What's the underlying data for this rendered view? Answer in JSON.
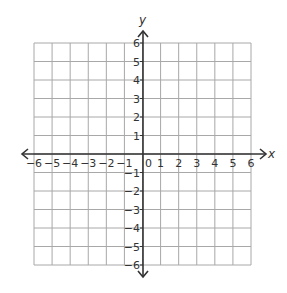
{
  "chart_data": {
    "type": "coordinate-grid",
    "title": "",
    "xlabel": "x",
    "ylabel": "y",
    "xlim": [
      -6,
      6
    ],
    "ylim": [
      -6,
      6
    ],
    "grid": true,
    "x_ticks": [
      "−6",
      "−5",
      "−4",
      "−3",
      "−2",
      "−1",
      "0",
      "1",
      "2",
      "3",
      "4",
      "5",
      "6"
    ],
    "y_ticks": [
      "6",
      "5",
      "4",
      "3",
      "2",
      "1",
      "−1",
      "−2",
      "−3",
      "−4",
      "−5",
      "−6"
    ],
    "origin_label": "0",
    "series": []
  },
  "colors": {
    "grid": "#a8a8a8",
    "axis": "#333333",
    "text": "#333333"
  }
}
